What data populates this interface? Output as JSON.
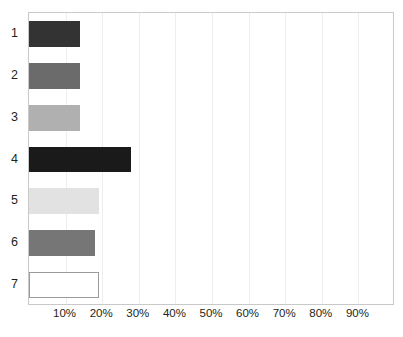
{
  "chart_data": {
    "type": "bar",
    "orientation": "horizontal",
    "title": "",
    "xlabel": "",
    "ylabel": "",
    "categories": [
      "1",
      "2",
      "3",
      "4",
      "5",
      "6",
      "7"
    ],
    "values": [
      14,
      14,
      14,
      28,
      19,
      18,
      19
    ],
    "value_suffix": "%",
    "xlim": [
      0,
      100
    ],
    "xticks": [
      10,
      20,
      30,
      40,
      50,
      60,
      70,
      80,
      90
    ],
    "xtick_labels": [
      "10%",
      "20%",
      "30%",
      "40%",
      "50%",
      "60%",
      "70%",
      "80%",
      "90%"
    ],
    "ytick_labels": [
      "1",
      "2",
      "3",
      "4",
      "5",
      "6",
      "7"
    ],
    "grid": {
      "vertical": true,
      "horizontal": false,
      "color": "#eceff1"
    },
    "legend": {
      "visible": false,
      "position": "none"
    },
    "bars": [
      {
        "category": "1",
        "value": 14,
        "fill": "#333333",
        "stroke": "#333333"
      },
      {
        "category": "2",
        "value": 14,
        "fill": "#6b6b6b",
        "stroke": "#6b6b6b"
      },
      {
        "category": "3",
        "value": 14,
        "fill": "#b0b0b0",
        "stroke": "#b0b0b0"
      },
      {
        "category": "4",
        "value": 28,
        "fill": "#1a1a1a",
        "stroke": "#1a1a1a"
      },
      {
        "category": "5",
        "value": 19,
        "fill": "#e2e2e2",
        "stroke": "#e2e2e2"
      },
      {
        "category": "6",
        "value": 18,
        "fill": "#767676",
        "stroke": "#767676"
      },
      {
        "category": "7",
        "value": 19,
        "fill": "#ffffff",
        "stroke": "#9a9a9a"
      }
    ],
    "colors": {
      "plot_border": "#c9c9c9",
      "axis_text": "#231f20",
      "background": "#ffffff"
    }
  }
}
